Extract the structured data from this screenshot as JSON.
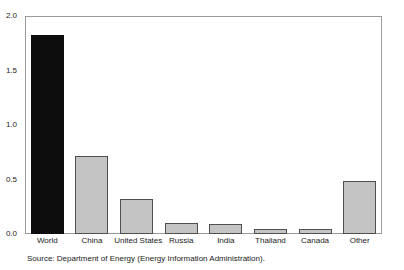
{
  "chart_data": {
    "type": "bar",
    "title": "",
    "subtitle": "",
    "xlabel": "",
    "ylabel": "",
    "categories": [
      "World",
      "China",
      "United States",
      "Russia",
      "India",
      "Thailand",
      "Canada",
      "Other"
    ],
    "values": [
      1.83,
      0.72,
      0.32,
      0.1,
      0.09,
      0.05,
      0.05,
      0.49
    ],
    "series": [
      {
        "name": "",
        "values": [
          1.83,
          0.72,
          0.32,
          0.1,
          0.09,
          0.05,
          0.05,
          0.49
        ]
      }
    ],
    "bar_colors": [
      "#0d0d0d",
      "#c4c4c4",
      "#c4c4c4",
      "#c4c4c4",
      "#c4c4c4",
      "#c4c4c4",
      "#c4c4c4",
      "#c4c4c4"
    ],
    "ylim": [
      0.0,
      2.0
    ],
    "y_ticks": [
      0.0,
      0.5,
      1.0,
      1.5,
      2.0
    ],
    "y_tick_labels": [
      "0.0",
      "0.5",
      "1.0",
      "1.5",
      "2.0"
    ],
    "grid": false,
    "legend": null,
    "legend_position": "none",
    "annotations": [],
    "frame_color": "#9a9a9a"
  },
  "caption": {
    "source_note": "Source: Department of Energy (Energy Information Administration)."
  }
}
